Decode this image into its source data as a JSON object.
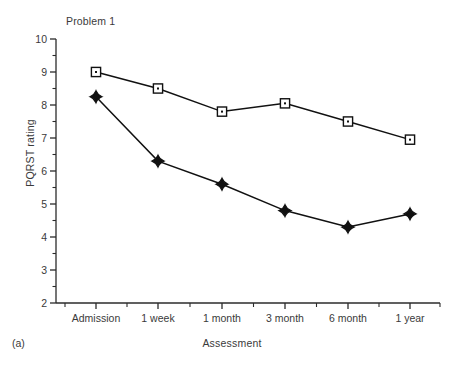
{
  "figure": {
    "panel_label": "(a)",
    "title": "Problem 1"
  },
  "chart_data": {
    "type": "line",
    "title": "Problem 1",
    "xlabel": "Assessment",
    "ylabel": "PQRST rating",
    "categories": [
      "Admission",
      "1 week",
      "1 month",
      "3 month",
      "6 month",
      "1 year"
    ],
    "ylim": [
      2,
      10
    ],
    "ytick_labels": [
      "2",
      "3",
      "4",
      "5",
      "6",
      "7",
      "8",
      "9",
      "10"
    ],
    "ytick_values": [
      2,
      3,
      4,
      5,
      6,
      7,
      8,
      9,
      10
    ],
    "y_minor_tick_interval": 0.5,
    "grid": false,
    "legend": "none",
    "series": [
      {
        "name": "open-square-series",
        "marker": "open-square",
        "color": "#111111",
        "values": [
          9.0,
          8.5,
          7.8,
          8.05,
          7.5,
          6.95
        ]
      },
      {
        "name": "filled-diamond-series",
        "marker": "filled-diamond",
        "color": "#111111",
        "values": [
          8.25,
          6.3,
          5.6,
          4.8,
          4.3,
          4.7
        ]
      }
    ]
  }
}
